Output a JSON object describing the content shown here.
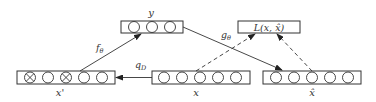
{
  "diagram": {
    "colors": {
      "stroke": "#333333",
      "background": "#ffffff"
    },
    "nodes": {
      "y": {
        "label": "y",
        "cells": [
          "circle",
          "circle",
          "circle"
        ]
      },
      "loss": {
        "label": "L(x, x̂)"
      },
      "x_corrupted": {
        "label": "x'",
        "cells": [
          "crossed-circle",
          "circle",
          "crossed-circle",
          "circle",
          "circle"
        ]
      },
      "x": {
        "label": "x",
        "cells": [
          "circle",
          "circle",
          "circle",
          "circle",
          "circle"
        ]
      },
      "x_hat": {
        "label": "x̂",
        "cells": [
          "circle",
          "circle",
          "circle",
          "circle",
          "circle"
        ]
      }
    },
    "edges": [
      {
        "from": "x",
        "to": "x_corrupted",
        "label": "q",
        "subscript": "D",
        "style": "solid"
      },
      {
        "from": "x_corrupted",
        "to": "y",
        "label": "f",
        "subscript": "θ",
        "style": "solid"
      },
      {
        "from": "y",
        "to": "x_hat",
        "label": "g",
        "subscript": "θ",
        "style": "solid"
      },
      {
        "from": "x",
        "to": "loss",
        "label": "",
        "style": "dashed"
      },
      {
        "from": "x_hat",
        "to": "loss",
        "label": "",
        "style": "dashed"
      }
    ]
  }
}
